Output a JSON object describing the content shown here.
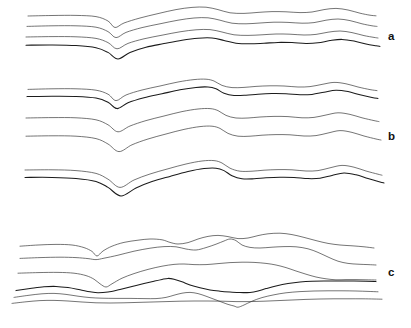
{
  "figure": {
    "title": "",
    "background_color": "#ffffff",
    "line_color": "#2b2b2b",
    "width": 411,
    "height": 328
  },
  "panels": [
    {
      "id": "a",
      "label": "a",
      "label_x": 388,
      "label_y": 31,
      "horizon_count": 4,
      "style": "concentric parallel folds"
    },
    {
      "id": "b",
      "label": "b",
      "label_x": 388,
      "label_y": 131,
      "horizon_count": 6,
      "style": "paired horizons with spaced interbeds"
    },
    {
      "id": "c",
      "label": "c",
      "label_x": 388,
      "label_y": 267,
      "horizon_count": 6,
      "style": "disharmonic, converging and crossing horizons"
    }
  ],
  "chart_data": {
    "type": "line",
    "title": "",
    "xlabel": "",
    "ylabel": "",
    "xlim": [
      0,
      411
    ],
    "ylim": [
      0,
      328
    ],
    "grid": false,
    "legend": "right",
    "series": [
      {
        "name": "a-1",
        "panel": "a",
        "weight": "thin",
        "points": "28,16 52,15.5 76,15.4 96,16.6 108,21 115,27.5 124,23 140,18 158,13.6 176,9.6 192,7.4 206,7.2 218,9.6 230,12.8 244,13.4 258,12.4 272,11.6 286,11.8 300,12.6 312,12 324,9.6 336,8.4 348,10 360,13.2 370,15.2 376,15.8"
      },
      {
        "name": "a-2",
        "panel": "a",
        "weight": "thin",
        "points": "27,26.4 52,25.8 76,25.8 96,27.2 108,31.6 116,37.6 126,32.4 142,27.6 160,23.8 178,20.2 194,18 208,17.8 220,20.2 232,23.2 246,23.8 260,23 274,22.2 288,22.4 302,23.2 314,22.6 326,20.2 338,19 350,20.6 362,23.8 372,25.8 377,26.4"
      },
      {
        "name": "a-3",
        "panel": "a",
        "weight": "thin",
        "points": "26,37 52,36.6 76,36.8 96,38.4 108,42.6 117,48.8 128,43.4 144,38.8 162,35.2 180,31.8 196,29.8 210,29.6 222,32 234,34.8 248,35.4 262,34.8 276,34 290,34.2 304,35 316,34.4 328,32.2 340,31 352,32.6 364,35.6 374,37.4 378,38"
      },
      {
        "name": "a-4",
        "panel": "a",
        "weight": "bold",
        "points": "26,45.2 52,45 76,45.6 96,47.8 108,52.4 118,59 130,52.4 146,47.2 164,43.6 182,40.2 198,38.2 212,38 224,40.4 236,43.2 250,43.8 264,43.2 278,42.4 292,42.6 306,43.4 318,42.8 330,40.6 342,39.4 354,41 366,44 376,45.8 380,46.4"
      },
      {
        "name": "b-1",
        "panel": "b",
        "weight": "thin",
        "points": "28,89.4 52,88.8 76,88.8 96,90.2 108,94.2 116,100.6 126,95 142,90 160,86 178,82 194,79.6 206,79.2 214,81 222,85.4 232,87.6 244,87.4 256,86.4 270,85.8 284,86 298,87 310,86.6 322,84.4 334,82.4 346,83.8 358,87 370,89.6 377,90.6"
      },
      {
        "name": "b-2",
        "panel": "b",
        "weight": "bold",
        "points": "27,96.6 52,96.2 76,96.4 96,98 108,102.2 117,108.6 128,102.8 144,97.8 162,93.8 180,89.8 196,87.4 208,87 216,88.8 224,93.2 234,95.4 246,95.2 258,94.2 272,93.6 286,93.8 300,94.8 312,94.4 324,92.2 336,90.2 348,91.6 360,94.8 372,97.4 378,98.4"
      },
      {
        "name": "b-3",
        "panel": "b",
        "weight": "thin",
        "points": "26,118 52,117.6 76,117.8 96,119.8 108,124.8 118,131.8 130,126 146,120.6 164,116 182,111.6 198,109 210,108.6 218,110.6 226,115.4 236,118 248,118 260,117 274,116.4 288,116.6 302,117.8 314,117.4 326,115 338,112.8 350,114.4 362,117.8 374,120.6 379,121.6"
      },
      {
        "name": "b-4",
        "panel": "b",
        "weight": "thin",
        "points": "26,136.2 52,135.8 76,136.2 96,138.6 108,144 119,151.6 132,144.8 148,139 166,134 184,129.4 200,126.6 212,126.2 220,128.4 228,133.4 238,136.2 250,136.2 262,135.2 276,134.6 290,134.8 304,136 316,135.6 328,133 340,130.6 352,132.4 364,136 376,139 381,140"
      },
      {
        "name": "b-5",
        "panel": "b",
        "weight": "thin",
        "points": "25,170 52,169.8 76,170.6 96,173.4 108,179.2 120,187.4 134,180 150,174 168,168.8 186,164 202,161 214,160.6 222,163 230,168.2 240,171.2 252,171.2 264,170.2 278,169.6 292,169.8 306,171 318,170.6 330,167.8 342,165.4 354,167.2 366,171 378,174.2 382,175.2"
      },
      {
        "name": "b-6",
        "panel": "b",
        "weight": "bold",
        "points": "25,177.4 52,177.4 76,178.4 96,181.4 108,187.4 121,196 136,188 152,181.6 170,176.4 188,171.6 204,168.6 216,168.2 224,170.6 232,175.8 242,178.8 254,178.8 266,177.8 280,177.2 294,177.4 308,178.6 320,178.2 332,175.4 344,173 356,174.8 368,178.6 380,182 384,183"
      },
      {
        "name": "c-1",
        "panel": "c",
        "weight": "thin",
        "points": "20,246.2 38,245 56,244.4 72,245 84,247.6 92,251.4 97,256 103,251 112,246.2 124,242.4 138,240.2 150,239 162,239.8 170,242.4 178,244 188,242.6 198,239 208,236.4 218,235.4 228,236.6 238,238.6 248,238 258,235.6 268,233.8 280,233.2 292,234.6 304,237.4 316,240.6 328,243.4 340,245 352,245.8 364,246.8 374,248"
      },
      {
        "name": "c-2",
        "panel": "c",
        "weight": "thin",
        "points": "20,258.4 40,257.6 60,257.2 76,257.6 88,258.6 96,259.6 104,258.2 118,255.2 134,251.2 150,248.2 164,246.6 176,246.8 186,249 196,250 206,247.6 216,244.2 224,241 230,239 236,240.6 242,245 250,247.4 260,248 272,247.2 284,246.6 296,246.8 308,248.8 318,252.4 328,257 338,261.2 348,263.4 358,264.2 368,264.6 376,265"
      },
      {
        "name": "c-3",
        "panel": "c",
        "weight": "thin",
        "points": "18,273.2 38,272.6 58,272.4 74,273.2 86,275.6 94,279.2 100,283.8 106,287 112,283.8 122,278.2 134,273.6 148,269.4 162,266.2 174,264.4 184,264 194,264.6 206,264.6 218,263.6 230,262.6 242,262.2 254,262.4 266,263.4 276,265 286,267.6 296,271 306,274.2 316,277 326,278.8 336,279.8 346,279.6 356,279.6 366,279.8 376,280"
      },
      {
        "name": "c-4",
        "panel": "c",
        "weight": "bold",
        "points": "16,290.6 30,288.6 44,286.8 56,286.4 68,287.6 80,289.8 90,291.8 98,292.8 108,292 120,289.4 132,286.6 144,283.6 154,281.2 162,279.4 168,278.4 174,279.2 182,281.8 190,285 200,287.8 210,290 220,291.2 230,292 240,292.6 250,292.4 258,291 266,288.6 276,286 288,283.6 300,282 312,281.2 326,281 340,281 354,281 366,281.2 376,281.6"
      },
      {
        "name": "c-5",
        "panel": "c",
        "weight": "thin",
        "points": "14,297.4 28,295.4 42,293.8 54,293.4 66,294.4 78,296.2 90,297.6 102,298.2 116,298.4 130,298.4 144,298.6 156,298.6 166,297.4 174,295.2 182,293.2 190,292.4 198,293.6 206,296.2 214,299.2 222,302.2 228,304.4 234,306 238,307.2 244,305 252,301.2 262,297.6 274,294.8 286,292.8 300,291.6 314,291 328,290.8 342,290.8 356,291 368,291.4 378,291.8"
      },
      {
        "name": "c-6",
        "panel": "c",
        "weight": "thin",
        "points": "12,303.4 26,301.8 40,300.6 54,300.4 68,301 82,302 96,302.8 110,303 124,302.8 138,302.4 152,302 166,301.6 180,301.2 194,301 208,301 222,301.2 236,301.6 250,301.6 264,301.2 278,300.6 292,300 306,299.4 320,299 334,298.8 348,298.8 362,298.8 374,299 382,299.2"
      }
    ]
  }
}
